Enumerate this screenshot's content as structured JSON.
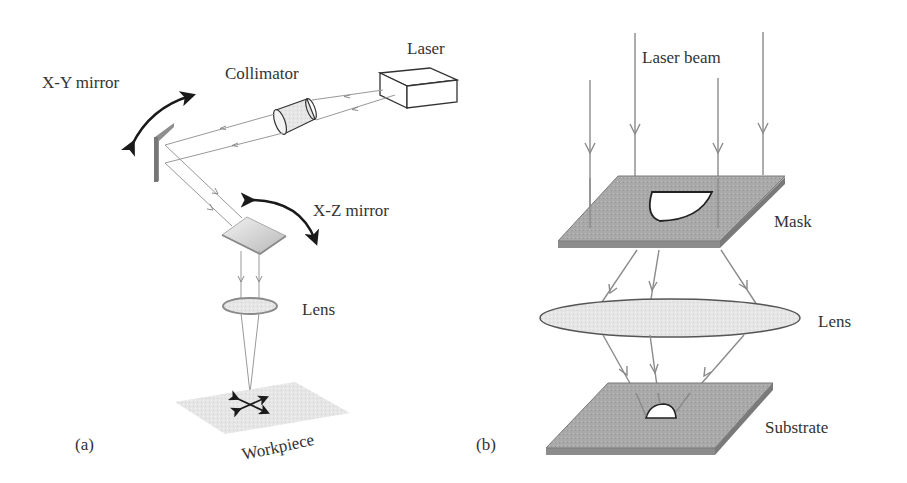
{
  "figure": {
    "panel_a": {
      "label": "(a)",
      "components": {
        "laser": "Laser",
        "collimator": "Collimator",
        "xy_mirror": "X-Y mirror",
        "xz_mirror": "X-Z mirror",
        "lens": "Lens",
        "workpiece": "Workpiece"
      }
    },
    "panel_b": {
      "label": "(b)",
      "components": {
        "laser_beam": "Laser beam",
        "mask": "Mask",
        "lens": "Lens",
        "substrate": "Substrate"
      }
    },
    "colors": {
      "beam": "#8a8a8a",
      "plate_fill": "#a8a8a8",
      "plate_edge": "#7a7a7a",
      "lens_fill": "#eeeeee",
      "text": "#333333",
      "rotation_arrow": "#1a1a1a"
    }
  }
}
